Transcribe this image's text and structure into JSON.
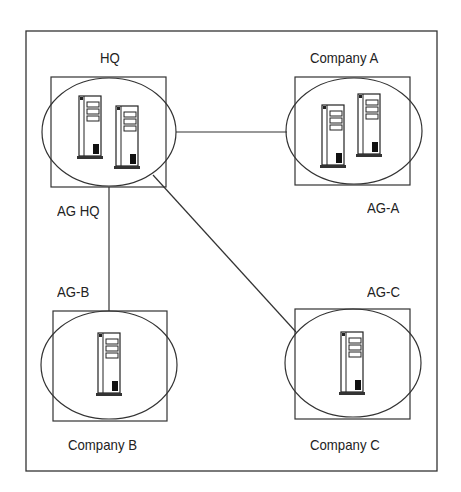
{
  "diagram": {
    "nodes": [
      {
        "id": "hq",
        "top_label": "HQ",
        "bottom_label": "AG HQ",
        "servers": 2
      },
      {
        "id": "company-a",
        "top_label": "Company A",
        "bottom_label": "AG-A",
        "servers": 2
      },
      {
        "id": "company-b",
        "top_label": "AG-B",
        "bottom_label": "Company B",
        "servers": 1
      },
      {
        "id": "company-c",
        "top_label": "AG-C",
        "bottom_label": "Company C",
        "servers": 1
      }
    ],
    "edges": [
      {
        "from": "hq",
        "to": "company-a"
      },
      {
        "from": "hq",
        "to": "company-b"
      },
      {
        "from": "hq",
        "to": "company-c"
      }
    ],
    "icons": {
      "server": "server-tower-icon"
    }
  }
}
